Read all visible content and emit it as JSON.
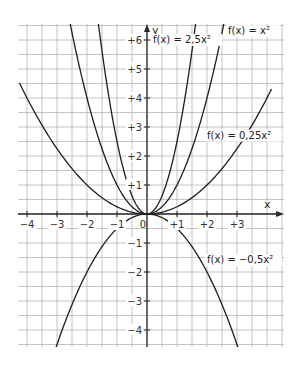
{
  "chart_data": {
    "type": "line",
    "title": "",
    "xlabel": "x",
    "ylabel": "y",
    "xlim": [
      -4.3,
      4.6
    ],
    "ylim": [
      -4.5,
      6.6
    ],
    "grid": true,
    "grid_step": 0.5,
    "x_ticks": [
      {
        "value": -4,
        "label": "−4"
      },
      {
        "value": -3,
        "label": "−3"
      },
      {
        "value": -2,
        "label": "−2"
      },
      {
        "value": -1,
        "label": "−1"
      },
      {
        "value": 1,
        "label": "+1"
      },
      {
        "value": 2,
        "label": "+2"
      },
      {
        "value": 3,
        "label": "+3"
      }
    ],
    "y_ticks": [
      {
        "value": 6,
        "label": "+6"
      },
      {
        "value": 5,
        "label": "+5"
      },
      {
        "value": 4,
        "label": "+4"
      },
      {
        "value": 3,
        "label": "+3"
      },
      {
        "value": 2,
        "label": "+2"
      },
      {
        "value": 1,
        "label": "+1"
      },
      {
        "value": -1,
        "label": "−1"
      },
      {
        "value": -2,
        "label": "−2"
      },
      {
        "value": -3,
        "label": "−3"
      },
      {
        "value": -4,
        "label": "−4"
      }
    ],
    "origin_label": "0",
    "series": [
      {
        "name": "f(x) = 2,5x²",
        "a": 2.5,
        "x_range": [
          -1.65,
          1.65
        ],
        "label": "f(x) = 2,5x²",
        "label_at": {
          "x": 0.2,
          "y": 5.9
        }
      },
      {
        "name": "f(x) = x²",
        "a": 1,
        "x_range": [
          -2.6,
          2.6
        ],
        "label": "f(x) = x²",
        "label_at": {
          "x": 2.7,
          "y": 6.2
        }
      },
      {
        "name": "f(x) = 0,25x²",
        "a": 0.25,
        "x_range": [
          -4.25,
          4.15
        ],
        "label": "f(x) = 0,25x²",
        "label_at": {
          "x": 2.0,
          "y": 2.6
        }
      },
      {
        "name": "f(x) = −0,5x²",
        "a": -0.5,
        "x_range": [
          -3.05,
          3.05
        ],
        "label": "f(x) = −0,5x²",
        "label_at": {
          "x": 2.0,
          "y": -1.7
        }
      }
    ]
  }
}
